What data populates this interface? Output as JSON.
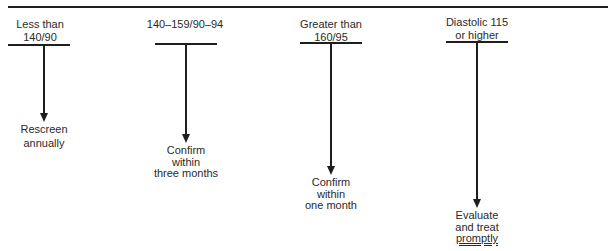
{
  "diagram": {
    "type": "flowchart",
    "branches": [
      {
        "category": [
          "Less than",
          "140/90"
        ],
        "action": [
          "Rescreen",
          "annually"
        ]
      },
      {
        "category": [
          "140–159/90–94"
        ],
        "action": [
          "Confirm",
          "within",
          "three months"
        ]
      },
      {
        "category": [
          "Greater than",
          "160/95"
        ],
        "action": [
          "Confirm",
          "within",
          "one month"
        ]
      },
      {
        "category": [
          "Diastolic 115",
          "or higher"
        ],
        "action": [
          "Evaluate",
          "and treat",
          "promptly"
        ],
        "emphasized_word": "promptly"
      }
    ]
  },
  "colors": {
    "line": "#1e1e1e",
    "text": "#2a2a2a",
    "background": "#ffffff"
  }
}
